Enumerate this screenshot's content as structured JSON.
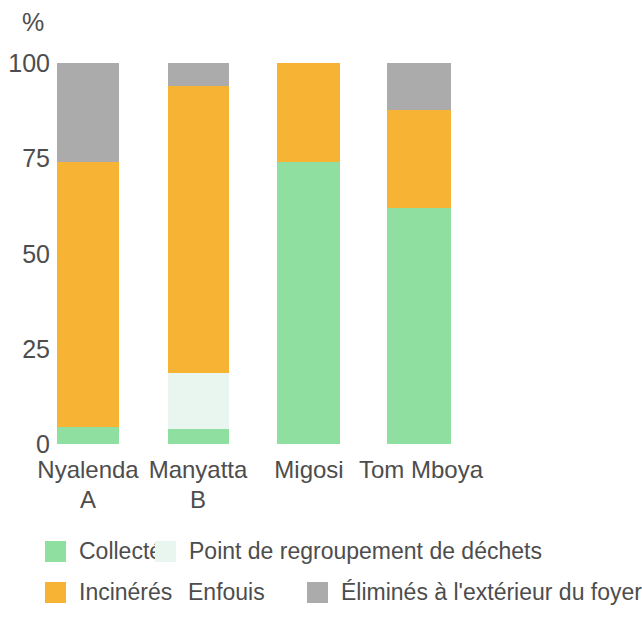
{
  "chart_data": {
    "type": "bar",
    "stacked": true,
    "title": "",
    "subtitle": "",
    "xlabel": "",
    "ylabel": "%",
    "ylim": [
      0,
      100
    ],
    "yticks": [
      0,
      25,
      50,
      75,
      100
    ],
    "ytick_labels": [
      "0",
      "25",
      "50",
      "75",
      "100"
    ],
    "grid": false,
    "legend_position": "bottom",
    "categories": [
      "Nyalenda\nA",
      "Manyatta\nB",
      "Migosi",
      "Tom Mboya"
    ],
    "category_labels": [
      "Nyalenda A",
      "Manyatta B",
      "Migosi",
      "Tom Mboya"
    ],
    "series": [
      {
        "name": "Collectés",
        "color": "#8FDFA0",
        "values": [
          4,
          4,
          74,
          62
        ]
      },
      {
        "name": "Point de regroupement de déchets",
        "color": "#E8F6EE",
        "values": [
          0,
          15,
          0,
          0
        ]
      },
      {
        "name": "Incinérés",
        "color": "#F7B334",
        "values": [
          70,
          75,
          26,
          26
        ]
      },
      {
        "name": "Enfouis",
        "color": "#FFFFFF",
        "values": [
          0,
          0,
          0,
          0
        ]
      },
      {
        "name": "Éliminés à l'extérieur du foyer",
        "color": "#ABABAB",
        "values": [
          26,
          6,
          0,
          12
        ]
      }
    ]
  },
  "axis": {
    "unit_label": "%",
    "ticks": [
      {
        "value": 100,
        "label": "100"
      },
      {
        "value": 75,
        "label": "75"
      },
      {
        "value": 50,
        "label": "50"
      },
      {
        "value": 25,
        "label": "25"
      },
      {
        "value": 0,
        "label": "0"
      }
    ]
  },
  "bars": [
    {
      "category": "Nyalenda\nA",
      "left": 57,
      "width": 62,
      "segments": [
        {
          "series": "Collectés",
          "value": 4.5,
          "color": "#8FDFA0"
        },
        {
          "series": "Incinérés",
          "value": 69.5,
          "color": "#F7B334"
        },
        {
          "series": "Éliminés à l'extérieur du foyer",
          "value": 26,
          "color": "#ABABAB"
        }
      ]
    },
    {
      "category": "Manyatta\nB",
      "left": 168,
      "width": 61,
      "segments": [
        {
          "series": "Collectés",
          "value": 4,
          "color": "#8FDFA0"
        },
        {
          "series": "Point de regroupement de déchets",
          "value": 14.6,
          "color": "#E9F6EF"
        },
        {
          "series": "Incinérés",
          "value": 75.4,
          "color": "#F7B334"
        },
        {
          "series": "Éliminés à l'extérieur du foyer",
          "value": 6,
          "color": "#ABABAB"
        }
      ]
    },
    {
      "category": "Migosi",
      "left": 277,
      "width": 63,
      "segments": [
        {
          "series": "Collectés",
          "value": 74,
          "color": "#8FDFA0"
        },
        {
          "series": "Incinérés",
          "value": 26,
          "color": "#F7B334"
        }
      ]
    },
    {
      "category": "Tom Mboya",
      "left": 387,
      "width": 64,
      "segments": [
        {
          "series": "Collectés",
          "value": 62,
          "color": "#8FDFA0"
        },
        {
          "series": "Incinérés",
          "value": 25.7,
          "color": "#F7B334"
        },
        {
          "series": "Éliminés à l'extérieur du foyer",
          "value": 12.3,
          "color": "#ABABAB"
        }
      ]
    }
  ],
  "x_labels": [
    {
      "text": "Nyalenda\nA",
      "center": 88
    },
    {
      "text": "Manyatta\nB",
      "center": 198
    },
    {
      "text": "Migosi",
      "center": 309
    },
    {
      "text": "Tom Mboya",
      "center": 421
    }
  ],
  "legend": {
    "rows": [
      {
        "items": [
          {
            "label": "Collectés",
            "color": "#8FDFA0",
            "swatch": true,
            "left": 45
          },
          {
            "label": "Point de regroupement de déchets",
            "color": "#E9F6EF",
            "swatch": true,
            "left": 155
          }
        ]
      },
      {
        "items": [
          {
            "label": "Incinérés",
            "color": "#F7B334",
            "swatch": true,
            "left": 45
          },
          {
            "label": "Enfouis",
            "color": "#FFFFFF",
            "swatch": false,
            "left": 188
          },
          {
            "label": "Éliminés à l'extérieur du foyer",
            "color": "#ABABAB",
            "swatch": true,
            "left": 307
          }
        ]
      }
    ]
  },
  "colors": {
    "collected_green": "#8FDFA0",
    "collection_point_mint": "#E9F6EF",
    "incinerated_orange": "#F7B334",
    "buried_white": "#FFFFFF",
    "outside_gray": "#ABABAB",
    "text": "#4D4D4D",
    "background": "#FFFFFF"
  }
}
